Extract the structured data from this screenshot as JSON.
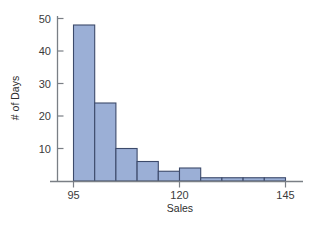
{
  "chart_data": {
    "type": "bar",
    "title": "",
    "subtitle": "",
    "xlabel": "Sales",
    "ylabel": "# of Days",
    "xlim": [
      92.5,
      147.5
    ],
    "ylim": [
      0,
      52
    ],
    "xticks": [
      95,
      120,
      145
    ],
    "xtick_labels": [
      "95",
      "120",
      "145"
    ],
    "yticks": [
      10,
      20,
      30,
      40,
      50
    ],
    "ytick_labels": [
      "10",
      "20",
      "30",
      "40",
      "50"
    ],
    "grid": false,
    "legend": null,
    "bin_width": 5,
    "bin_edges": [
      95,
      100,
      105,
      110,
      115,
      120,
      125,
      130,
      135,
      140,
      145
    ],
    "categories": [
      "95-100",
      "100-105",
      "105-110",
      "110-115",
      "115-120",
      "120-125",
      "125-130",
      "130-135",
      "135-140",
      "140-145"
    ],
    "values": [
      48,
      24,
      10,
      6,
      3,
      4,
      1,
      1,
      1,
      1
    ],
    "bar_fill_color": "#9BAFD6",
    "bar_edge_color": "#3C4A6B",
    "axis_color": "#7A7F85",
    "text_color": "#3B3B3B"
  },
  "labels": {
    "x_axis_title": "Sales",
    "y_axis_title": "# of Days"
  }
}
